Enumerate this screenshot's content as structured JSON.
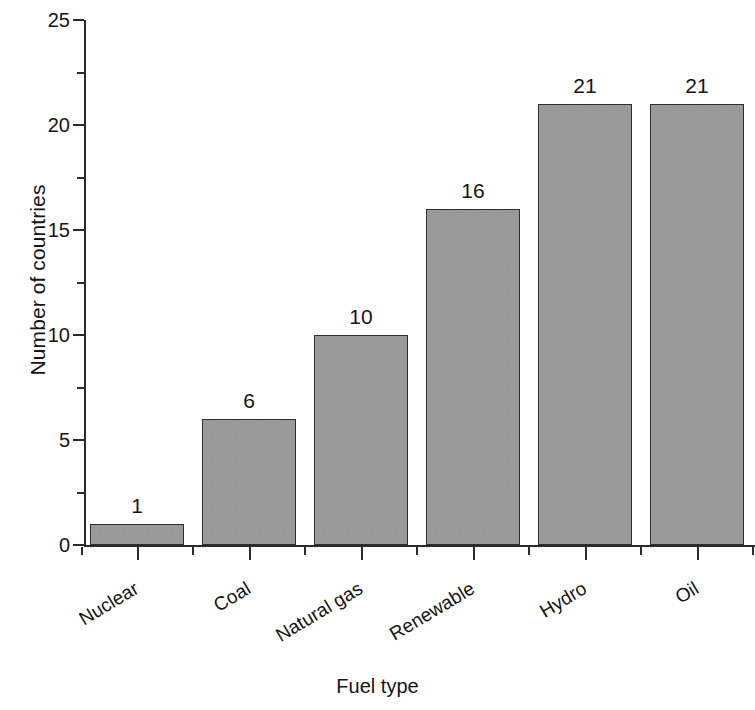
{
  "chart_data": {
    "type": "bar",
    "title": "",
    "subtitle": "",
    "xlabel": "Fuel type",
    "ylabel": "Number of countries",
    "categories": [
      "Nuclear",
      "Coal",
      "Natural gas",
      "Renewable",
      "Hydro",
      "Oil"
    ],
    "values": [
      1,
      6,
      10,
      16,
      21,
      21
    ],
    "data_labels": [
      "1",
      "6",
      "10",
      "16",
      "21",
      "21"
    ],
    "ylim": [
      0,
      25
    ],
    "ytick_labels": [
      "0",
      "5",
      "10",
      "15",
      "20",
      "25"
    ],
    "ytick_values": [
      0,
      5,
      10,
      15,
      20,
      25
    ],
    "yminor_tick_values": [
      2.5,
      7.5,
      12.5,
      17.5,
      22.5
    ],
    "grid": false,
    "legend": false,
    "legend_position": "none",
    "bar_fill_color": "#9b9b9b",
    "bar_edge_color": "#2e2e2e",
    "axis_color": "#2b2b2b",
    "text_color": "#141414",
    "background_color": "#ffffff",
    "category_label_rotation_deg": -31
  }
}
